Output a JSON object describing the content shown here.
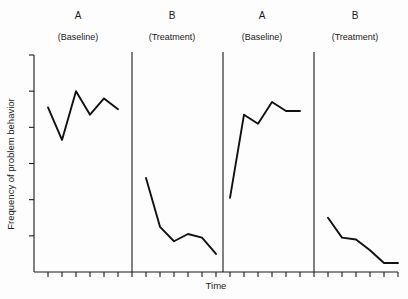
{
  "chart_data": {
    "type": "line",
    "title": "",
    "xlabel": "Time",
    "ylabel": "Frequency of problem behavior",
    "design": "ABAB reversal (withdrawal) single-subject design",
    "grid": false,
    "legend": "none",
    "markers": "none",
    "xlim": [
      0,
      26
    ],
    "ylim": [
      0,
      6
    ],
    "x_tick_count": 26,
    "y_tick_count": 6,
    "x_tick_labels": [],
    "y_tick_labels": [],
    "phases": [
      {
        "id": "A1",
        "label": "A",
        "sublabel": "(Baseline)",
        "condition": "Baseline",
        "x_start": 1,
        "x_end": 6,
        "x": [
          1,
          2,
          3,
          4,
          5,
          6
        ],
        "values": [
          4.55,
          3.65,
          5.0,
          4.35,
          4.8,
          4.5
        ]
      },
      {
        "id": "B1",
        "label": "B",
        "sublabel": "(Treatment)",
        "condition": "Treatment",
        "x_start": 8,
        "x_end": 13,
        "x": [
          8,
          9,
          10,
          11,
          12,
          13
        ],
        "values": [
          2.6,
          1.25,
          0.85,
          1.05,
          0.95,
          0.5
        ]
      },
      {
        "id": "A2",
        "label": "A",
        "sublabel": "(Baseline)",
        "condition": "Baseline",
        "x_start": 14,
        "x_end": 19,
        "x": [
          14,
          15,
          16,
          17,
          18,
          19
        ],
        "values": [
          2.05,
          4.35,
          4.1,
          4.7,
          4.45,
          4.45
        ]
      },
      {
        "id": "B2",
        "label": "B",
        "sublabel": "(Treatment)",
        "condition": "Treatment",
        "x_start": 21,
        "x_end": 26,
        "x": [
          21,
          22,
          23,
          24,
          25,
          26
        ],
        "values": [
          1.5,
          0.95,
          0.9,
          0.6,
          0.25,
          0.25
        ]
      }
    ],
    "phase_dividers_x": [
      7,
      13.5,
      20
    ],
    "colors": {
      "line": "#111111",
      "axis": "#1a1a1a",
      "background": "#fdfdfd",
      "text": "#1a1a1a"
    }
  },
  "figure": {
    "phase_headers": [
      {
        "label": "A",
        "sublabel": "(Baseline)"
      },
      {
        "label": "B",
        "sublabel": "(Treatment)"
      },
      {
        "label": "A",
        "sublabel": "(Baseline)"
      },
      {
        "label": "B",
        "sublabel": "(Treatment)"
      }
    ],
    "x_axis_title": "Time",
    "y_axis_title": "Frequency of problem behavior"
  }
}
